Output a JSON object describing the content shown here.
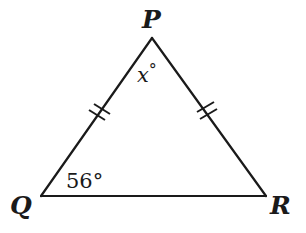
{
  "diagram": {
    "type": "isosceles-triangle",
    "stroke_color": "#1a1a1a",
    "vertices": {
      "P": {
        "label": "P",
        "x": 152,
        "y": 38
      },
      "Q": {
        "label": "Q",
        "x": 41,
        "y": 196
      },
      "R": {
        "label": "R",
        "x": 266,
        "y": 196
      }
    },
    "angles": {
      "apex": {
        "vertex": "P",
        "variable": "x",
        "degree_symbol": "°",
        "text": "x°"
      },
      "base_left": {
        "vertex": "Q",
        "value": "56°"
      }
    },
    "congruent_sides": [
      {
        "side": "PQ",
        "tick_count": 2
      },
      {
        "side": "PR",
        "tick_count": 2
      }
    ]
  }
}
